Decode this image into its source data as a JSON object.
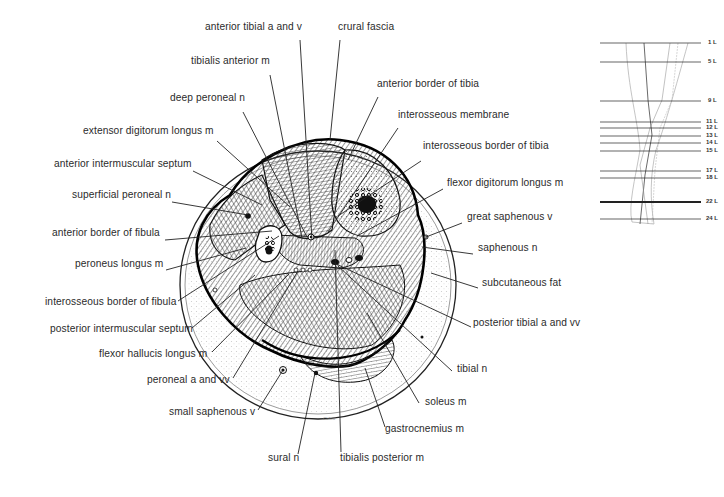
{
  "figure": {
    "type": "anatomical cross-section of the leg",
    "signature": "Cahill",
    "section_marked": "22 L"
  },
  "labels": [
    {
      "id": "anterior-tibial-a-and-v",
      "text": "anterior tibial a and v",
      "x": 205,
      "y": 27,
      "lx1": 300,
      "ly1": 40,
      "lx2": 312,
      "ly2": 240
    },
    {
      "id": "crural-fascia",
      "text": "crural fascia",
      "x": 338,
      "y": 27,
      "lx1": 340,
      "ly1": 40,
      "lx2": 330,
      "ly2": 140
    },
    {
      "id": "tibialis-anterior-m",
      "text": "tibialis anterior m",
      "x": 191,
      "y": 61,
      "lx1": 270,
      "ly1": 75,
      "lx2": 302,
      "ly2": 238
    },
    {
      "id": "anterior-border-of-tibia",
      "text": "anterior border of tibia",
      "x": 377,
      "y": 84,
      "lx1": 378,
      "ly1": 97,
      "lx2": 348,
      "ly2": 160
    },
    {
      "id": "deep-peroneal-n",
      "text": "deep peroneal n",
      "x": 170,
      "y": 98,
      "lx1": 243,
      "ly1": 112,
      "lx2": 307,
      "ly2": 237
    },
    {
      "id": "interosseous-membrane",
      "text": "interosseous membrane",
      "x": 398,
      "y": 115,
      "lx1": 398,
      "ly1": 128,
      "lx2": 328,
      "ly2": 232
    },
    {
      "id": "extensor-digitorum-longus-m",
      "text": "extensor digitorum longus m",
      "x": 83,
      "y": 131,
      "lx1": 217,
      "ly1": 141,
      "lx2": 290,
      "ly2": 207
    },
    {
      "id": "interosseous-border-of-tibia",
      "text": "interosseous border of tibia",
      "x": 423,
      "y": 146,
      "lx1": 421,
      "ly1": 161,
      "lx2": 338,
      "ly2": 216
    },
    {
      "id": "anterior-intermuscular-septum",
      "text": "anterior intermuscular septum",
      "x": 54,
      "y": 164,
      "lx1": 193,
      "ly1": 171,
      "lx2": 262,
      "ly2": 205
    },
    {
      "id": "flexor-digitorum-longus-m",
      "text": "flexor digitorum longus m",
      "x": 447,
      "y": 183,
      "lx1": 443,
      "ly1": 189,
      "lx2": 357,
      "ly2": 236
    },
    {
      "id": "superficial-peroneal-n",
      "text": "superficial peroneal n",
      "x": 72,
      "y": 195,
      "lx1": 172,
      "ly1": 202,
      "lx2": 248,
      "ly2": 215
    },
    {
      "id": "great-saphenous-v",
      "text": "great saphenous v",
      "x": 467,
      "y": 217,
      "lx1": 462,
      "ly1": 223,
      "lx2": 426,
      "ly2": 237
    },
    {
      "id": "anterior-border-of-fibula",
      "text": "anterior border of fibula",
      "x": 52,
      "y": 233,
      "lx1": 165,
      "ly1": 240,
      "lx2": 272,
      "ly2": 231
    },
    {
      "id": "saphenous-n",
      "text": "saphenous n",
      "x": 478,
      "y": 248,
      "lx1": 473,
      "ly1": 254,
      "lx2": 422,
      "ly2": 247
    },
    {
      "id": "peroneus-longus-m",
      "text": "peroneus longus m",
      "x": 75,
      "y": 264,
      "lx1": 166,
      "ly1": 270,
      "lx2": 246,
      "ly2": 248
    },
    {
      "id": "subcutaneous-fat",
      "text": "subcutaneous fat",
      "x": 482,
      "y": 283,
      "lx1": 478,
      "ly1": 288,
      "lx2": 431,
      "ly2": 273
    },
    {
      "id": "interosseous-border-of-fibula",
      "text": "interosseous border of fibula",
      "x": 45,
      "y": 302,
      "lx1": 178,
      "ly1": 301,
      "lx2": 279,
      "ly2": 236
    },
    {
      "id": "posterior-intermuscular-septum",
      "text": "posterior intermuscular septum",
      "x": 50,
      "y": 329,
      "lx1": 192,
      "ly1": 328,
      "lx2": 255,
      "ly2": 275
    },
    {
      "id": "posterior-tibial-a-and-vv",
      "text": "posterior tibial a and vv",
      "x": 473,
      "y": 323,
      "lx1": 471,
      "ly1": 327,
      "lx2": 332,
      "ly2": 262
    },
    {
      "id": "flexor-hallucis-longus-m",
      "text": "flexor hallucis longus m",
      "x": 99,
      "y": 354,
      "lx1": 212,
      "ly1": 352,
      "lx2": 289,
      "ly2": 274
    },
    {
      "id": "tibial-n",
      "text": "tibial n",
      "x": 457,
      "y": 369,
      "lx1": 452,
      "ly1": 371,
      "lx2": 338,
      "ly2": 266
    },
    {
      "id": "peroneal-a-and-vv",
      "text": "peroneal a and vv",
      "x": 147,
      "y": 380,
      "lx1": 233,
      "ly1": 378,
      "lx2": 298,
      "ly2": 271
    },
    {
      "id": "small-saphenous-v",
      "text": "small saphenous v",
      "x": 169,
      "y": 412,
      "lx1": 258,
      "ly1": 410,
      "lx2": 283,
      "ly2": 370
    },
    {
      "id": "soleus-m",
      "text": "soleus m",
      "x": 425,
      "y": 402,
      "lx1": 419,
      "ly1": 403,
      "lx2": 367,
      "ly2": 313
    },
    {
      "id": "gastrocnemius-m",
      "text": "gastrocnemius m",
      "x": 385,
      "y": 429,
      "lx1": 385,
      "ly1": 427,
      "lx2": 365,
      "ly2": 368
    },
    {
      "id": "sural-n",
      "text": "sural n",
      "x": 268,
      "y": 458,
      "lx1": 298,
      "ly1": 454,
      "lx2": 315,
      "ly2": 373
    },
    {
      "id": "tibialis-posterior-m",
      "text": "tibialis posterior m",
      "x": 340,
      "y": 458,
      "lx1": 341,
      "ly1": 452,
      "lx2": 335,
      "ly2": 250
    }
  ],
  "levels": [
    {
      "label": "1 L",
      "y": 43,
      "bold": false
    },
    {
      "label": "5 L",
      "y": 62,
      "bold": false
    },
    {
      "label": "9 L",
      "y": 101,
      "bold": false
    },
    {
      "label": "11 L",
      "y": 122,
      "bold": false
    },
    {
      "label": "12 L",
      "y": 128,
      "bold": false
    },
    {
      "label": "13 L",
      "y": 136,
      "bold": false
    },
    {
      "label": "14 L",
      "y": 143,
      "bold": false
    },
    {
      "label": "15 L",
      "y": 151,
      "bold": false
    },
    {
      "label": "17 L",
      "y": 171,
      "bold": false
    },
    {
      "label": "18 L",
      "y": 178,
      "bold": false
    },
    {
      "label": "22 L",
      "y": 202,
      "bold": true
    },
    {
      "label": "24 L",
      "y": 219,
      "bold": false
    }
  ]
}
